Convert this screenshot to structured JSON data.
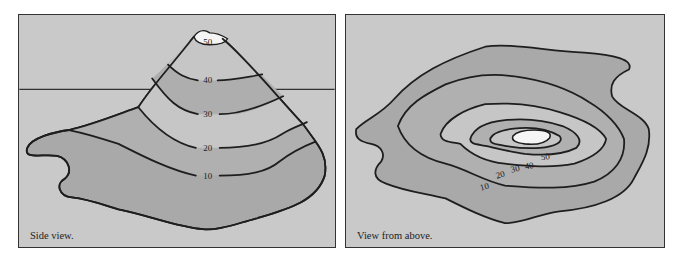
{
  "panels": {
    "side": {
      "caption": "Side view.",
      "contour_labels": [
        "50",
        "40",
        "30",
        "20",
        "10"
      ]
    },
    "above": {
      "caption": "View from above.",
      "contour_labels": [
        "50",
        "40",
        "30",
        "20",
        "10"
      ]
    }
  },
  "colors": {
    "background": "#c9c9c9",
    "band_dark": "#a9a9a9",
    "band_mid": "#b4b4b4",
    "band_light": "#c6c6c6",
    "summit": "#f5f5f5",
    "line": "#1e1e1e"
  }
}
